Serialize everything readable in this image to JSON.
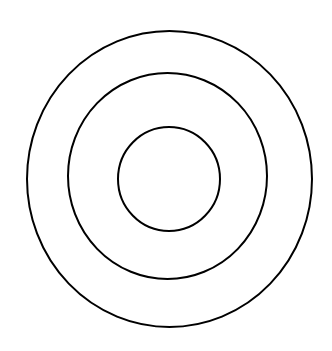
{
  "diagram": {
    "type": "concentric-circles",
    "canvas": {
      "width": 332,
      "height": 351,
      "background": "#ffffff"
    },
    "stroke": {
      "color": "#000000",
      "width": 2
    },
    "circles": [
      {
        "name": "outer-circle",
        "cx": 169.5,
        "cy": 179,
        "rx": 142.5,
        "ry": 148
      },
      {
        "name": "middle-circle",
        "cx": 167.5,
        "cy": 176,
        "rx": 99.5,
        "ry": 103
      },
      {
        "name": "inner-circle",
        "cx": 169,
        "cy": 179,
        "rx": 51,
        "ry": 52
      }
    ]
  }
}
